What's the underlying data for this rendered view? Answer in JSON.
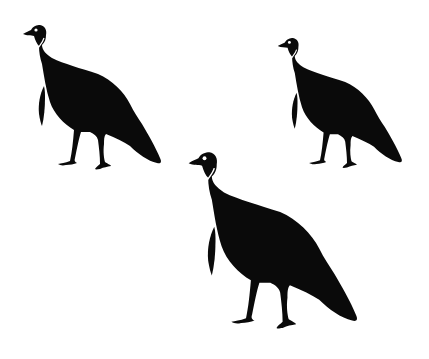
{
  "image": {
    "description": "Three black turkey silhouettes on a white background",
    "background": "#ffffff",
    "silhouette_color": "#0a0a0a",
    "highlight_color": "#ffffff"
  },
  "turkeys": [
    {
      "label": "turkey-top-left",
      "x": 20,
      "y": 24,
      "scale": 1.0
    },
    {
      "label": "turkey-top-right",
      "x": 275,
      "y": 37,
      "scale": 0.9
    },
    {
      "label": "turkey-bottom-center",
      "x": 185,
      "y": 151,
      "scale": 1.22
    }
  ]
}
